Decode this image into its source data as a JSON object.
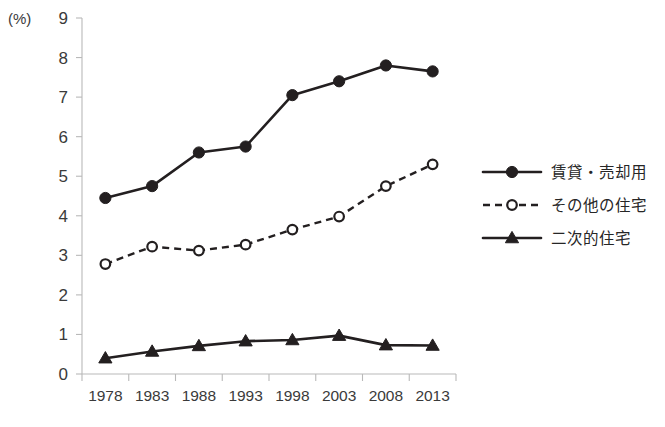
{
  "chart_data": {
    "type": "line",
    "title": "",
    "subtitle": "",
    "xlabel": "",
    "ylabel": "",
    "unit_label": "(%)",
    "categories": [
      "1978",
      "1983",
      "1988",
      "1993",
      "1998",
      "2003",
      "2008",
      "2013"
    ],
    "ylim": [
      0,
      9
    ],
    "yticks": [
      0,
      1,
      2,
      3,
      4,
      5,
      6,
      7,
      8,
      9
    ],
    "ytick_labels": [
      "0",
      "1",
      "2",
      "3",
      "4",
      "5",
      "6",
      "7",
      "8",
      "9"
    ],
    "grid": false,
    "legend_position": "right",
    "series": [
      {
        "name": "賃貸・売却用",
        "values": [
          4.45,
          4.75,
          5.6,
          5.75,
          7.05,
          7.4,
          7.8,
          7.65
        ],
        "marker": "filled-circle",
        "line_style": "solid",
        "color": "#231f20"
      },
      {
        "name": "その他の住宅",
        "values": [
          2.78,
          3.22,
          3.12,
          3.27,
          3.65,
          3.98,
          4.75,
          5.3
        ],
        "marker": "open-circle",
        "line_style": "dashed",
        "color": "#231f20"
      },
      {
        "name": "二次的住宅",
        "values": [
          0.4,
          0.57,
          0.71,
          0.83,
          0.86,
          0.97,
          0.73,
          0.72
        ],
        "marker": "filled-triangle",
        "line_style": "solid",
        "color": "#231f20"
      }
    ]
  },
  "legend": {
    "items": [
      {
        "label": "賃貸・売却用"
      },
      {
        "label": "その他の住宅"
      },
      {
        "label": "二次的住宅"
      }
    ]
  },
  "axes": {
    "unit": "(%)",
    "y_labels": [
      "9",
      "8",
      "7",
      "6",
      "5",
      "4",
      "3",
      "2",
      "1",
      "0"
    ],
    "x_labels": [
      "1978",
      "1983",
      "1988",
      "1993",
      "1998",
      "2003",
      "2008",
      "2013"
    ]
  },
  "colors": {
    "ink": "#231f20",
    "axis": "#b9b9b9",
    "text": "#3a3a3a",
    "background": "#ffffff"
  }
}
